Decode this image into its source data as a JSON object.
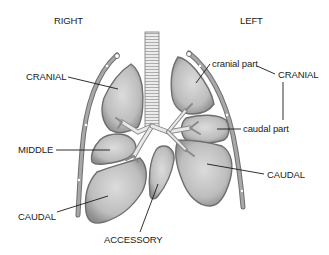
{
  "diagram": {
    "side_labels": {
      "right": "RIGHT",
      "left": "LEFT"
    },
    "right_lung": {
      "lobes": [
        {
          "id": "cranial",
          "label": "CRANIAL"
        },
        {
          "id": "middle",
          "label": "MIDDLE"
        },
        {
          "id": "caudal",
          "label": "CAUDAL"
        },
        {
          "id": "accessory",
          "label": "ACCESSORY"
        }
      ]
    },
    "left_lung": {
      "group_label": "CRANIAL",
      "parts": [
        {
          "id": "cranial-part",
          "label": "cranial part"
        },
        {
          "id": "caudal-part",
          "label": "caudal part"
        }
      ],
      "lobes": [
        {
          "id": "caudal",
          "label": "CAUDAL"
        }
      ]
    },
    "colors": {
      "lobe_fill": "#b9b9b9",
      "lobe_light": "#d6d6d6",
      "lobe_edge": "#7a7a7a",
      "trachea": "#e4e4e4",
      "rib": "#8c8c8c",
      "leader_line": "#1a1a1a",
      "text": "#1a1a1a"
    }
  }
}
